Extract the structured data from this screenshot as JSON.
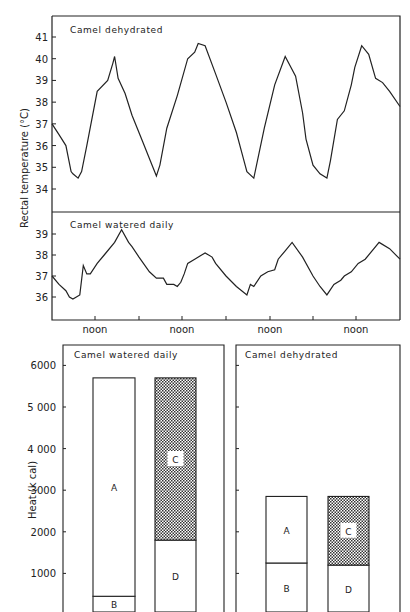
{
  "chart_data": [
    {
      "type": "line",
      "title": "Camel dehydrated",
      "ylabel": "Rectal temperature (°C)",
      "xlabel": "",
      "x_tick_labels": [
        "noon",
        "noon",
        "noon",
        "noon"
      ],
      "y_ticks": [
        34,
        35,
        36,
        37,
        38,
        39,
        40,
        41
      ],
      "ylim": [
        33,
        41.5
      ],
      "x": [
        0,
        0.02,
        0.04,
        0.055,
        0.06,
        0.075,
        0.085,
        0.1,
        0.13,
        0.16,
        0.175,
        0.18,
        0.19,
        0.21,
        0.23,
        0.26,
        0.29,
        0.3,
        0.31,
        0.33,
        0.36,
        0.39,
        0.41,
        0.42,
        0.44,
        0.47,
        0.5,
        0.53,
        0.55,
        0.56,
        0.58,
        0.61,
        0.64,
        0.67,
        0.7,
        0.72,
        0.73,
        0.75,
        0.77,
        0.79,
        0.8,
        0.82,
        0.84,
        0.86,
        0.87,
        0.89,
        0.91,
        0.93,
        0.95,
        0.97,
        1.0
      ],
      "values": [
        37.0,
        36.5,
        36.0,
        34.8,
        34.7,
        34.5,
        34.8,
        36.0,
        38.5,
        39.0,
        39.8,
        40.1,
        39.1,
        38.4,
        37.4,
        36.2,
        35.0,
        34.6,
        35.1,
        36.8,
        38.3,
        40.0,
        40.3,
        40.7,
        40.6,
        39.3,
        38.0,
        36.6,
        35.4,
        34.8,
        34.5,
        36.8,
        38.8,
        40.1,
        39.2,
        37.5,
        36.3,
        35.1,
        34.7,
        34.5,
        35.3,
        37.2,
        37.6,
        38.8,
        39.6,
        40.6,
        40.2,
        39.1,
        38.9,
        38.5,
        37.8
      ],
      "series_name": "Camel dehydrated"
    },
    {
      "type": "line",
      "title": "Camel watered daily",
      "ylabel": "Rectal temperature (°C)",
      "xlabel": "",
      "x_tick_labels": [
        "noon",
        "noon",
        "noon",
        "noon"
      ],
      "y_ticks": [
        36,
        37,
        38,
        39
      ],
      "ylim": [
        35,
        40
      ],
      "x": [
        0,
        0.02,
        0.04,
        0.05,
        0.06,
        0.07,
        0.08,
        0.09,
        0.1,
        0.11,
        0.13,
        0.15,
        0.18,
        0.2,
        0.22,
        0.23,
        0.25,
        0.28,
        0.3,
        0.32,
        0.33,
        0.35,
        0.36,
        0.37,
        0.38,
        0.39,
        0.41,
        0.44,
        0.46,
        0.47,
        0.5,
        0.53,
        0.56,
        0.57,
        0.58,
        0.6,
        0.62,
        0.64,
        0.65,
        0.67,
        0.69,
        0.72,
        0.75,
        0.77,
        0.79,
        0.81,
        0.83,
        0.84,
        0.86,
        0.88,
        0.9,
        0.94,
        0.97,
        1.0
      ],
      "values": [
        37.0,
        36.6,
        36.3,
        36.0,
        35.9,
        36.0,
        36.1,
        37.5,
        37.1,
        37.1,
        37.6,
        38.0,
        38.6,
        39.2,
        38.6,
        38.4,
        37.9,
        37.2,
        36.9,
        36.9,
        36.6,
        36.6,
        36.5,
        36.7,
        37.1,
        37.6,
        37.8,
        38.1,
        37.9,
        37.6,
        37.0,
        36.5,
        36.1,
        36.6,
        36.5,
        37.0,
        37.2,
        37.3,
        37.8,
        38.2,
        38.6,
        37.9,
        37.0,
        36.5,
        36.1,
        36.6,
        36.8,
        37.0,
        37.2,
        37.6,
        37.8,
        38.6,
        38.3,
        37.8
      ],
      "series_name": "Camel watered daily"
    },
    {
      "type": "bar",
      "stacked": true,
      "title": "Camel watered daily",
      "ylabel": "Heat (k cal)",
      "y_ticks": [
        1000,
        2000,
        3000,
        4000,
        5000,
        6000
      ],
      "y_tick_labels": [
        "1000",
        "2000",
        "3000",
        "4 000",
        "5 000",
        "6000"
      ],
      "ylim": [
        0,
        6200
      ],
      "categories": [
        "A+B",
        "C+D"
      ],
      "series": [
        {
          "name": "B",
          "bar": 0,
          "value": 450
        },
        {
          "name": "A",
          "bar": 0,
          "value": 5250
        },
        {
          "name": "D",
          "bar": 1,
          "value": 1800
        },
        {
          "name": "C",
          "bar": 1,
          "value": 3900,
          "pattern": "stippled"
        }
      ],
      "totals": [
        5700,
        5700
      ]
    },
    {
      "type": "bar",
      "stacked": true,
      "title": "Camel dehydrated",
      "ylabel": "Heat (k cal)",
      "ylim": [
        0,
        6200
      ],
      "categories": [
        "A+B",
        "C+D"
      ],
      "series": [
        {
          "name": "B",
          "bar": 0,
          "value": 1250
        },
        {
          "name": "A",
          "bar": 0,
          "value": 1600
        },
        {
          "name": "D",
          "bar": 1,
          "value": 1200
        },
        {
          "name": "C",
          "bar": 1,
          "value": 1650,
          "pattern": "stippled"
        }
      ],
      "totals": [
        2850,
        2850
      ]
    }
  ],
  "labels": {
    "top_title": "Camel dehydrated",
    "mid_title": "Camel watered daily",
    "temp_ylabel": "Rectal temperature (°C)",
    "noon": "noon",
    "bar_left_title": "Camel watered daily",
    "bar_right_title": "Camel dehydrated",
    "heat_ylabel": "Heat (k cal)",
    "seg_A": "A",
    "seg_B": "B",
    "seg_C": "C",
    "seg_D": "D",
    "top_ticks": [
      "41",
      "40",
      "39",
      "38",
      "37",
      "36",
      "35",
      "34"
    ],
    "mid_ticks": [
      "39",
      "38",
      "37",
      "36"
    ],
    "heat_ticks": [
      "6000",
      "5 000",
      "4 000",
      "3000",
      "2000",
      "1000"
    ]
  }
}
